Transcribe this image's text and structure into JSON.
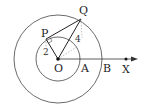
{
  "diagram": {
    "type": "geometry",
    "points": {
      "O": {
        "label": "O"
      },
      "P": {
        "label": "P"
      },
      "Q": {
        "label": "Q"
      },
      "A": {
        "label": "A"
      },
      "B": {
        "label": "B"
      },
      "X": {
        "label": "X"
      }
    },
    "lengths": {
      "OP": "2",
      "OQ": "4"
    },
    "circles": [
      {
        "name": "inner-circle",
        "center": "O",
        "radius_label": "2"
      },
      {
        "name": "outer-circle",
        "center": "O",
        "radius_label": "4"
      }
    ],
    "ray": {
      "from": "O",
      "through": "X"
    },
    "colors": {
      "stroke": "#333333",
      "dashed": "#999999"
    }
  }
}
